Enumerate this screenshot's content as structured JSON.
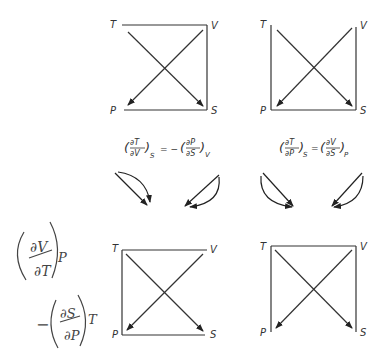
{
  "diagrams": [
    {
      "id": "top-left",
      "labels": {
        "tl": "T",
        "tr": "V",
        "bl": "P",
        "br": "S"
      },
      "missing_edge": "left"
    },
    {
      "id": "top-right",
      "labels": {
        "tl": "T",
        "tr": "V",
        "bl": "P",
        "br": "S"
      },
      "missing_edge": "top"
    },
    {
      "id": "bottom-left",
      "labels": {
        "tl": "T",
        "tr": "V",
        "bl": "P",
        "br": "S"
      },
      "missing_edge": "right"
    },
    {
      "id": "bottom-right",
      "labels": {
        "tl": "T",
        "tr": "V",
        "bl": "P",
        "br": "S"
      },
      "missing_edge": "bottom"
    }
  ],
  "equations": {
    "left": {
      "lhs_num": "∂T",
      "lhs_den": "∂V",
      "lhs_sub": "S",
      "op": "= −",
      "rhs_num": "∂P",
      "rhs_den": "∂S",
      "rhs_sub": "V"
    },
    "right": {
      "lhs_num": "∂T",
      "lhs_den": "∂P",
      "lhs_sub": "S",
      "op": "=",
      "rhs_num": "∂V",
      "rhs_den": "∂S",
      "rhs_sub": "P"
    }
  },
  "handwritten": {
    "first": {
      "num": "∂V",
      "den": "∂T",
      "sub": "P"
    },
    "second": {
      "sign": "−",
      "num": "∂S",
      "den": "∂P",
      "sub": "T"
    }
  }
}
